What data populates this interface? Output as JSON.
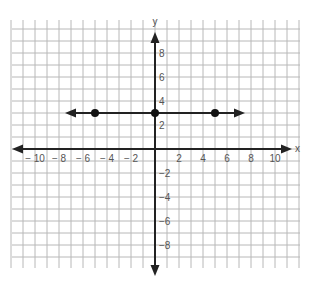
{
  "chart_data": {
    "type": "line",
    "title": "",
    "xlabel": "x",
    "ylabel": "y",
    "xlim": [
      -12,
      12
    ],
    "ylim": [
      -10,
      10
    ],
    "grid": true,
    "x_tick_labels": [
      "-10",
      "-8",
      "-6",
      "-4",
      "-2",
      "2",
      "4",
      "6",
      "8",
      "10"
    ],
    "x_ticks": [
      -10,
      -8,
      -6,
      -4,
      -2,
      2,
      4,
      6,
      8,
      10
    ],
    "y_tick_labels": [
      "8",
      "6",
      "4",
      "2",
      "-2",
      "-4",
      "-6",
      "-8"
    ],
    "y_ticks": [
      8,
      6,
      4,
      2,
      -2,
      -4,
      -6,
      -8
    ],
    "series": [
      {
        "name": "y = 3",
        "kind": "line-with-arrows",
        "x": [
          -7.5,
          7.5
        ],
        "y": [
          3,
          3
        ]
      },
      {
        "name": "points",
        "kind": "scatter",
        "x": [
          -5,
          0,
          5
        ],
        "y": [
          3,
          3,
          3
        ]
      }
    ]
  },
  "colors": {
    "grid": "#b8b8b8",
    "axis": "#222222",
    "line": "#222222",
    "point": "#111111",
    "label": "#555555"
  }
}
